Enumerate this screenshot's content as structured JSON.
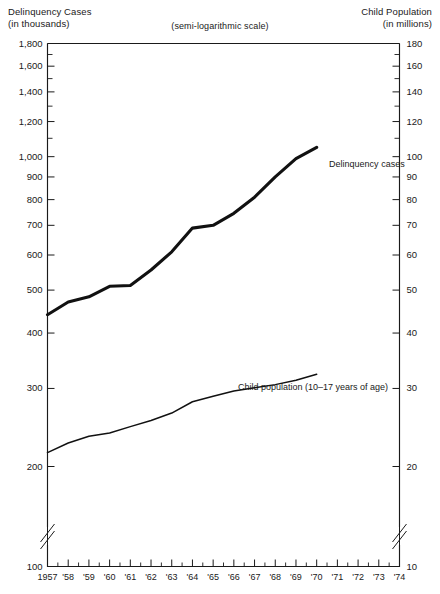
{
  "header": {
    "left_title": "Delinquency Cases",
    "left_unit": "(in thousands)",
    "right_title": "Child Population",
    "right_unit": "(in millions)",
    "scale_note": "(semi-logarithmic scale)"
  },
  "chart_data": {
    "type": "line",
    "title": "",
    "subtitle": "(semi-logarithmic scale)",
    "scale": "semi-logarithmic",
    "xlabel": "",
    "ylabel": "Delinquency Cases (in thousands)",
    "y2label": "Child Population (in millions)",
    "grid": false,
    "legend": "inline-annotation",
    "x_axis": {
      "tick_labels": [
        "1957",
        "'58",
        "'59",
        "'60",
        "'61",
        "'62",
        "'63",
        "'64",
        "'65",
        "'66",
        "'67",
        "'68",
        "'69",
        "'70",
        "'71",
        "'72",
        "'73",
        "'74"
      ],
      "values": [
        1957,
        1958,
        1959,
        1960,
        1961,
        1962,
        1963,
        1964,
        1965,
        1966,
        1967,
        1968,
        1969,
        1970,
        1971,
        1972,
        1973,
        1974
      ],
      "xlim": [
        1957,
        1974
      ],
      "minor_ticks": "half-year"
    },
    "y_left": {
      "unit": "thousands",
      "ylim": [
        400,
        1800
      ],
      "axis_break_below": 200,
      "tick_labels": [
        "1,800",
        "1,600",
        "1,400",
        "1,200",
        "1,000",
        "900",
        "800",
        "700",
        "600",
        "500",
        "400",
        "300",
        "200",
        "100"
      ],
      "tick_values": [
        1800,
        1600,
        1400,
        1200,
        1000,
        900,
        800,
        700,
        600,
        500,
        400,
        300,
        200,
        100
      ],
      "minor_tick_values": [
        1700,
        1500,
        1300,
        1100
      ]
    },
    "y_right": {
      "unit": "millions",
      "tick_labels": [
        "180",
        "160",
        "140",
        "120",
        "100",
        "90",
        "80",
        "70",
        "60",
        "50",
        "40",
        "30",
        "20",
        "10"
      ],
      "tick_values": [
        180,
        160,
        140,
        120,
        100,
        90,
        80,
        70,
        60,
        50,
        40,
        30,
        20,
        10
      ],
      "minor_tick_values": [
        170,
        150,
        130,
        110
      ],
      "axis_break_below": 20
    },
    "series": [
      {
        "name": "Delinquency cases",
        "label": "Delinquency cases",
        "unit": "thousands",
        "axis": "left",
        "x": [
          1957,
          1958,
          1959,
          1960,
          1961,
          1962,
          1963,
          1964,
          1965,
          1966,
          1967,
          1968,
          1969,
          1970
        ],
        "values": [
          440,
          470,
          483,
          510,
          512,
          555,
          610,
          690,
          700,
          745,
          810,
          900,
          990,
          1050
        ]
      },
      {
        "name": "Child population (10-17 years of age)",
        "label": "Child population (10–17 years of age)",
        "unit": "millions",
        "axis": "right",
        "x": [
          1957,
          1958,
          1959,
          1960,
          1961,
          1962,
          1963,
          1964,
          1965,
          1966,
          1967,
          1968,
          1969,
          1970
        ],
        "values": [
          21.5,
          22.6,
          23.4,
          23.8,
          24.6,
          25.4,
          26.4,
          28.0,
          28.8,
          29.6,
          30.1,
          30.6,
          31.3,
          32.3
        ]
      }
    ],
    "annotations": [
      {
        "text": "Delinquency cases",
        "x": 1970.6,
        "y": 960
      },
      {
        "text": "Child population (10–17 years of age)",
        "x": 1966.2,
        "y": 300
      }
    ]
  },
  "colors": {
    "ink": "#1a1a1a",
    "background": "#ffffff",
    "curve": "#111111"
  }
}
